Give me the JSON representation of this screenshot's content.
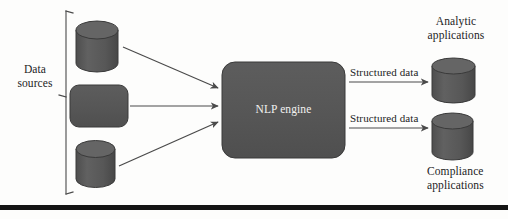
{
  "figure": {
    "background_color": "#fdfdfc",
    "shape_fill": "#575757",
    "shape_stroke": "#3d3d3d",
    "line_color": "#4a4a4a",
    "text_color": "#1c1c1c",
    "engine_text_color": "#f2f2f0",
    "footer_rule_color": "#141414"
  },
  "labels": {
    "data_sources": "Data\nsources",
    "engine": "NLP engine",
    "analytic": "Analytic\napplications",
    "compliance": "Compliance\napplications",
    "structured_data_top": "Structured data",
    "structured_data_bottom": "Structured data"
  },
  "diagram_data": {
    "type": "flow-diagram",
    "title": "NLP engine data flow",
    "direction": "left-to-right",
    "groups": [
      {
        "name": "data-sources",
        "label": "Data sources",
        "bracket": {
          "x": 66,
          "y_top": 11,
          "y_bottom": 194
        },
        "members": [
          "source-database-top",
          "source-store-middle",
          "source-database-bottom"
        ]
      }
    ],
    "nodes": [
      {
        "id": "source-database-top",
        "shape": "cylinder",
        "label": "",
        "x": 76,
        "y": 21,
        "width": 42,
        "height": 51
      },
      {
        "id": "source-store-middle",
        "shape": "rounded-rect",
        "label": "",
        "x": 70,
        "y": 85,
        "width": 58,
        "height": 42
      },
      {
        "id": "source-database-bottom",
        "shape": "cylinder",
        "label": "",
        "x": 76,
        "y": 140,
        "width": 39,
        "height": 48
      },
      {
        "id": "nlp-engine",
        "shape": "rounded-rect",
        "label": "NLP engine",
        "x": 222,
        "y": 62,
        "width": 123,
        "height": 96
      },
      {
        "id": "analytic-applications",
        "shape": "cylinder",
        "label": "Analytic applications",
        "x": 432,
        "y": 58,
        "width": 43,
        "height": 45
      },
      {
        "id": "compliance-applications",
        "shape": "cylinder",
        "label": "Compliance applications",
        "x": 432,
        "y": 113,
        "width": 41,
        "height": 47
      }
    ],
    "edges": [
      {
        "from": "source-database-top",
        "to": "nlp-engine",
        "label": "",
        "arrow": true
      },
      {
        "from": "source-store-middle",
        "to": "nlp-engine",
        "label": "",
        "arrow": true
      },
      {
        "from": "source-database-bottom",
        "to": "nlp-engine",
        "label": "",
        "arrow": true
      },
      {
        "from": "nlp-engine",
        "to": "analytic-applications",
        "label": "Structured data",
        "arrow": true
      },
      {
        "from": "nlp-engine",
        "to": "compliance-applications",
        "label": "Structured data",
        "arrow": true
      }
    ]
  }
}
